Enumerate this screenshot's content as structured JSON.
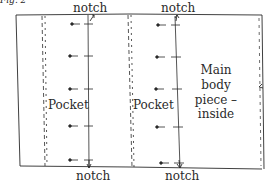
{
  "figure": {
    "caption_fragment": "Fig. 2"
  },
  "labels": {
    "notch_top_left": "notch",
    "notch_top_right": "notch",
    "notch_bottom_left": "notch",
    "notch_bottom_right": "notch",
    "pocket_left": "Pocket",
    "pocket_right": "Pocket",
    "main_body_line1": "Main",
    "main_body_line2": "body",
    "main_body_line3": "piece –",
    "main_body_line4": "inside"
  },
  "colors": {
    "ink": "#2a2a2a",
    "background": "#ffffff"
  }
}
